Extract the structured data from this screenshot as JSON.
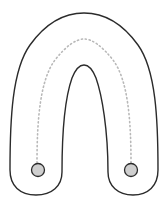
{
  "diagram": {
    "type": "arch-path",
    "colors": {
      "background": "#ffffff",
      "outline": "#2b2b2b",
      "dotted_path": "#b8b8b8",
      "endpoint_fill": "#cfcfcf",
      "endpoint_stroke": "#2b2b2b"
    },
    "shape": "inverted U (arch) outline",
    "path": "dotted centerline along arch",
    "endpoints": [
      {
        "name": "left-endpoint",
        "cx": 38,
        "cy": 170,
        "r": 6.5
      },
      {
        "name": "right-endpoint",
        "cx": 131,
        "cy": 170,
        "r": 6.5
      }
    ]
  }
}
